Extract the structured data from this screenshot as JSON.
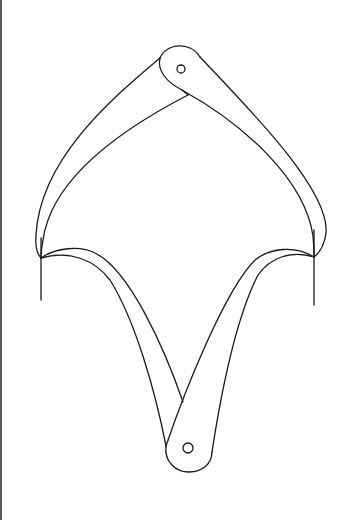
{
  "figure": {
    "stroke_color": "#1a1a1a",
    "background_color": "#ffffff",
    "border_color": "#5a5a5a",
    "parts": {
      "top_pivot": {
        "hole_center": [
          181,
          69
        ],
        "hole_radius": 4
      },
      "bottom_pivot": {
        "hole_center": [
          188,
          448
        ],
        "hole_radius": 5
      },
      "left_tip": {
        "point": [
          41,
          258
        ],
        "marker_line": [
          [
            41,
            238
          ],
          [
            41,
            300
          ]
        ]
      },
      "right_tip": {
        "point": [
          314,
          257
        ],
        "marker_line": [
          [
            314,
            230
          ],
          [
            314,
            305
          ]
        ]
      }
    }
  }
}
